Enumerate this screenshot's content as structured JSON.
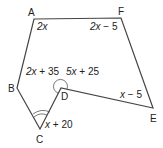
{
  "diagram": {
    "type": "polygon",
    "stroke_color": "#444444",
    "vertices": [
      {
        "name": "A",
        "x": 34,
        "y": 19,
        "label_x": 28,
        "label_y": 16
      },
      {
        "name": "F",
        "x": 121,
        "y": 18,
        "label_x": 118,
        "label_y": 15
      },
      {
        "name": "E",
        "x": 153,
        "y": 108,
        "label_x": 150,
        "label_y": 122
      },
      {
        "name": "D",
        "x": 61,
        "y": 88,
        "label_x": 61,
        "label_y": 100
      },
      {
        "name": "C",
        "x": 40,
        "y": 129,
        "label_x": 36,
        "label_y": 143
      },
      {
        "name": "B",
        "x": 17,
        "y": 88,
        "label_x": 8,
        "label_y": 92
      }
    ],
    "angles": [
      {
        "vertex": "A",
        "expr_var": "2x",
        "expr_rest": "",
        "x": 37,
        "y": 30
      },
      {
        "vertex": "F",
        "expr_var": "2x",
        "expr_rest": " − 5",
        "x": 90,
        "y": 30
      },
      {
        "vertex": "B",
        "expr_var": "2x",
        "expr_rest": " + 35",
        "x": 26,
        "y": 75
      },
      {
        "vertex": "D",
        "expr_var": "5x",
        "expr_rest": " + 25",
        "x": 66,
        "y": 75
      },
      {
        "vertex": "E",
        "expr_var": "x",
        "expr_rest": " − 5",
        "x": 120,
        "y": 98
      },
      {
        "vertex": "C",
        "expr_var": "x",
        "expr_rest": " + 20",
        "x": 45,
        "y": 128
      }
    ],
    "labels": {
      "A": "A",
      "F": "F",
      "E": "E",
      "D": "D",
      "C": "C",
      "B": "B",
      "angle_A": "2x",
      "angle_F": "2x − 5",
      "angle_B": "2x + 35",
      "angle_D": "5x + 25",
      "angle_E": "x − 5",
      "angle_C": "x + 20"
    }
  }
}
